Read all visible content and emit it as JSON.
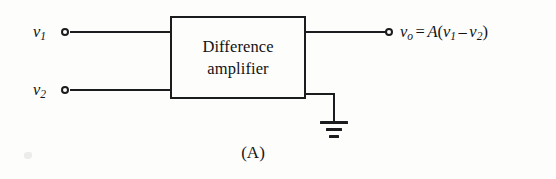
{
  "figure": {
    "caption": "(A)",
    "block": {
      "title_line1": "Difference",
      "title_line2": "amplifier"
    },
    "inputs": [
      {
        "name": "input-1",
        "symbol": "v",
        "subscript": "1",
        "terminal": "open-circle",
        "position": {
          "x": 65,
          "y": 32
        }
      },
      {
        "name": "input-2",
        "symbol": "v",
        "subscript": "2",
        "terminal": "open-circle",
        "position": {
          "x": 65,
          "y": 90
        }
      }
    ],
    "output": {
      "name": "output",
      "symbol": "v",
      "subscript": "o",
      "terminal": "open-circle",
      "position": {
        "x": 388,
        "y": 32
      },
      "equation": {
        "lhs_symbol": "v",
        "lhs_subscript": "o",
        "equals": "=",
        "gain": "A",
        "open_paren": "(",
        "term1_symbol": "v",
        "term1_subscript": "1",
        "minus": "–",
        "term2_symbol": "v",
        "term2_subscript": "2",
        "close_paren": ")",
        "plain_text": "v_o = A(v_1 - v_2)"
      }
    },
    "ground": {
      "name": "ground-symbol",
      "bars": 3,
      "position": {
        "x": 333,
        "y": 122
      }
    },
    "colors": {
      "ink": "#1b1c1e",
      "text": "#121315",
      "background": "#fdfdfc"
    }
  }
}
